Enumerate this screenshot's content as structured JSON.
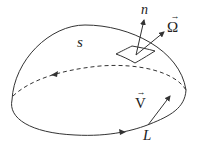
{
  "diagram": {
    "labels": {
      "surface": "s",
      "normal": "n",
      "omega": "Ω",
      "velocity": "V",
      "boundary": "L",
      "vec_arrow": "→"
    },
    "colors": {
      "stroke": "#333333",
      "background": "#ffffff"
    }
  }
}
